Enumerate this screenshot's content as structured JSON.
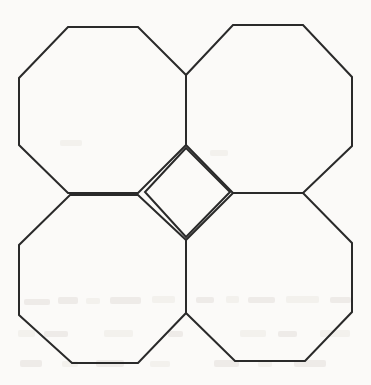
{
  "figure": {
    "background_color": "#fbfaf8",
    "stroke_color": "#2a2a2a",
    "stroke_width": 2,
    "canvas": {
      "width": 371,
      "height": 385
    },
    "shapes": [
      {
        "name": "octagon-top-left",
        "type": "regular-octagon",
        "label": "Top-left octagon",
        "center": [
          103,
          111
        ],
        "side_length": 70,
        "points": "68,27 138,27 186,75 186,145 138,193 68,193 19,145 19,78"
      },
      {
        "name": "octagon-top-right",
        "type": "regular-octagon",
        "label": "Top-right octagon",
        "center": [
          270,
          110
        ],
        "side_length": 70,
        "points": "233,25 303,25 352,77 352,146 303,193 233,193 186,145 186,75"
      },
      {
        "name": "octagon-bottom-left",
        "type": "regular-octagon",
        "label": "Bottom-left octagon",
        "center": [
          103,
          278
        ],
        "side_length": 70,
        "points": "70,195 138,195 186,240 186,313 138,363 72,363 19,315 19,245"
      },
      {
        "name": "octagon-bottom-right",
        "type": "regular-octagon",
        "label": "Bottom-right octagon",
        "center": [
          270,
          278
        ],
        "side_length": 70,
        "points": "233,193 303,193 352,243 352,312 305,361 235,361 186,313 186,240"
      },
      {
        "name": "square-center-gap",
        "type": "square-rotated-45",
        "label": "Central square gap",
        "center": [
          186,
          192
        ],
        "diagonal": 88,
        "points": "186,148 230,192 186,237 145,192"
      }
    ],
    "vertices": {
      "junction_top": [
        186,
        75
      ],
      "junction_left": [
        70,
        195
      ],
      "junction_right": [
        303,
        193
      ],
      "junction_bottom": [
        186,
        313
      ],
      "square_top": [
        186,
        148
      ],
      "square_right": [
        230,
        192
      ],
      "square_bottom": [
        186,
        237
      ],
      "square_left": [
        145,
        192
      ]
    },
    "artifacts": {
      "name": "scan-bleed-through",
      "label": "Faint reverse-side print show-through (illegible)",
      "visible": true
    }
  }
}
